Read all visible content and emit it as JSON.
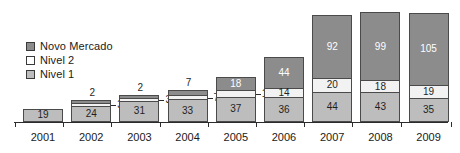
{
  "chart_data": {
    "type": "bar",
    "stacked": true,
    "title": "",
    "subtitle": "",
    "xlabel": "",
    "ylabel": "",
    "grid": false,
    "axis_visible": {
      "x": true,
      "y": false
    },
    "legend_position": "inside-top-left",
    "categories": [
      "2001",
      "2002",
      "2003",
      "2004",
      "2005",
      "2006",
      "2007",
      "2008",
      "2009"
    ],
    "series": [
      {
        "name": "Nivel 1",
        "color": "#bdbdbd",
        "values": [
          19,
          24,
          31,
          33,
          37,
          36,
          44,
          43,
          35
        ]
      },
      {
        "name": "Nivel 2",
        "color": "#f2f2f2",
        "values": [
          0,
          3,
          3,
          7,
          10,
          14,
          20,
          18,
          19
        ]
      },
      {
        "name": "Novo Mercado",
        "color": "#8c8c8c",
        "values": [
          0,
          2,
          2,
          7,
          18,
          44,
          92,
          99,
          105
        ]
      }
    ],
    "totals": [
      19,
      29,
      36,
      47,
      65,
      94,
      156,
      160,
      159
    ],
    "ymax": 160
  },
  "legend": {
    "items": [
      {
        "label": "Novo Mercado",
        "swatch": "dark-gray"
      },
      {
        "label": "Nivel 2",
        "swatch": "white"
      },
      {
        "label": "Nivel 1",
        "swatch": "medium-gray"
      }
    ]
  },
  "colors": {
    "novo_mercado": "#8c8c8c",
    "nivel2": "#f2f2f2",
    "nivel1": "#bdbdbd",
    "outline": "#4a4a4a",
    "axis": "#2b2b2b",
    "background": "#ffffff"
  },
  "bars": [
    {
      "year": "2001",
      "nivel1": {
        "value": "19",
        "placement": "inside"
      },
      "nivel2": {
        "value": "",
        "placement": "none"
      },
      "novo_mercado": {
        "value": "",
        "placement": "none"
      }
    },
    {
      "year": "2002",
      "nivel1": {
        "value": "24",
        "placement": "inside"
      },
      "nivel2": {
        "value": "3",
        "placement": "callout-right"
      },
      "novo_mercado": {
        "value": "2",
        "placement": "above"
      }
    },
    {
      "year": "2003",
      "nivel1": {
        "value": "31",
        "placement": "inside"
      },
      "nivel2": {
        "value": "3",
        "placement": "callout-right"
      },
      "novo_mercado": {
        "value": "2",
        "placement": "above"
      }
    },
    {
      "year": "2004",
      "nivel1": {
        "value": "33",
        "placement": "inside"
      },
      "nivel2": {
        "value": "7",
        "placement": "callout-right"
      },
      "novo_mercado": {
        "value": "7",
        "placement": "above"
      }
    },
    {
      "year": "2005",
      "nivel1": {
        "value": "37",
        "placement": "inside"
      },
      "nivel2": {
        "value": "10",
        "placement": "callout-right"
      },
      "novo_mercado": {
        "value": "18",
        "placement": "inside"
      }
    },
    {
      "year": "2006",
      "nivel1": {
        "value": "36",
        "placement": "inside"
      },
      "nivel2": {
        "value": "14",
        "placement": "inside"
      },
      "novo_mercado": {
        "value": "44",
        "placement": "inside"
      }
    },
    {
      "year": "2007",
      "nivel1": {
        "value": "44",
        "placement": "inside"
      },
      "nivel2": {
        "value": "20",
        "placement": "inside"
      },
      "novo_mercado": {
        "value": "92",
        "placement": "inside"
      }
    },
    {
      "year": "2008",
      "nivel1": {
        "value": "43",
        "placement": "inside"
      },
      "nivel2": {
        "value": "18",
        "placement": "inside"
      },
      "novo_mercado": {
        "value": "99",
        "placement": "inside"
      }
    },
    {
      "year": "2009",
      "nivel1": {
        "value": "35",
        "placement": "inside"
      },
      "nivel2": {
        "value": "19",
        "placement": "inside"
      },
      "novo_mercado": {
        "value": "105",
        "placement": "inside"
      }
    }
  ]
}
